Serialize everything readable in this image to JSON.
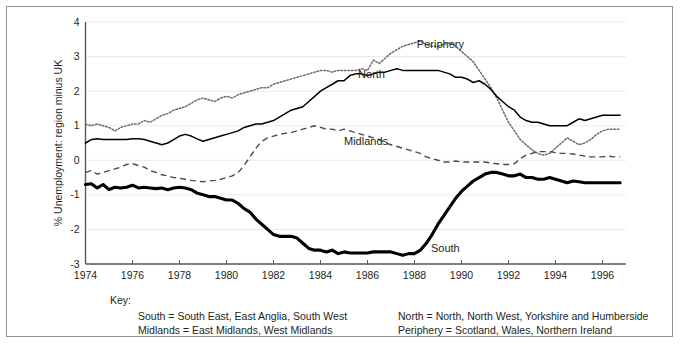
{
  "chart_data": {
    "type": "line",
    "title": "",
    "xlabel": "",
    "ylabel": "% Unemployment: region minus UK",
    "xlim": [
      1974,
      1997
    ],
    "ylim": [
      -3,
      4
    ],
    "xticks": [
      "1974",
      "1976",
      "1978",
      "1980",
      "1982",
      "1984",
      "1986",
      "1988",
      "1990",
      "1992",
      "1994",
      "1996"
    ],
    "yticks": [
      "4",
      "3",
      "2",
      "1",
      "0",
      "-1",
      "-2",
      "-3"
    ],
    "grid": true,
    "legend_position": "inline-labels",
    "x": [
      1974.0,
      1974.25,
      1974.5,
      1974.75,
      1975.0,
      1975.25,
      1975.5,
      1975.75,
      1976.0,
      1976.25,
      1976.5,
      1976.75,
      1977.0,
      1977.25,
      1977.5,
      1977.75,
      1978.0,
      1978.25,
      1978.5,
      1978.75,
      1979.0,
      1979.25,
      1979.5,
      1979.75,
      1980.0,
      1980.25,
      1980.5,
      1980.75,
      1981.0,
      1981.25,
      1981.5,
      1981.75,
      1982.0,
      1982.25,
      1982.5,
      1982.75,
      1983.0,
      1983.25,
      1983.5,
      1983.75,
      1984.0,
      1984.25,
      1984.5,
      1984.75,
      1985.0,
      1985.25,
      1985.5,
      1985.75,
      1986.0,
      1986.25,
      1986.5,
      1986.75,
      1987.0,
      1987.25,
      1987.5,
      1987.75,
      1988.0,
      1988.25,
      1988.5,
      1988.75,
      1989.0,
      1989.25,
      1989.5,
      1989.75,
      1990.0,
      1990.25,
      1990.5,
      1990.75,
      1991.0,
      1991.25,
      1991.5,
      1991.75,
      1992.0,
      1992.25,
      1992.5,
      1992.75,
      1993.0,
      1993.25,
      1993.5,
      1993.75,
      1994.0,
      1994.25,
      1994.5,
      1994.75,
      1995.0,
      1995.25,
      1995.5,
      1995.75,
      1996.0,
      1996.25,
      1996.5,
      1996.75
    ],
    "series": [
      {
        "name": "Periphery",
        "style": "dotted",
        "label_x": 1988.1,
        "label_y": 3.35,
        "values": [
          1.05,
          1.0,
          1.05,
          1.0,
          0.95,
          0.85,
          0.95,
          1.0,
          1.05,
          1.05,
          1.15,
          1.1,
          1.2,
          1.3,
          1.35,
          1.45,
          1.5,
          1.55,
          1.65,
          1.75,
          1.8,
          1.75,
          1.7,
          1.8,
          1.85,
          1.8,
          1.9,
          1.95,
          2.0,
          2.05,
          2.1,
          2.1,
          2.2,
          2.25,
          2.3,
          2.35,
          2.4,
          2.45,
          2.5,
          2.55,
          2.6,
          2.6,
          2.55,
          2.6,
          2.6,
          2.6,
          2.6,
          2.65,
          2.6,
          2.9,
          2.8,
          2.95,
          3.1,
          3.2,
          3.3,
          3.35,
          3.4,
          3.45,
          3.35,
          3.3,
          3.3,
          3.35,
          3.4,
          3.3,
          3.15,
          3.0,
          2.85,
          2.6,
          2.35,
          2.1,
          1.8,
          1.45,
          1.1,
          0.85,
          0.6,
          0.45,
          0.3,
          0.2,
          0.15,
          0.2,
          0.35,
          0.5,
          0.65,
          0.55,
          0.45,
          0.5,
          0.6,
          0.75,
          0.85,
          0.9,
          0.9,
          0.9
        ]
      },
      {
        "name": "North",
        "style": "solid-thin",
        "label_x": 1985.6,
        "label_y": 2.5,
        "values": [
          0.5,
          0.6,
          0.62,
          0.6,
          0.6,
          0.6,
          0.6,
          0.6,
          0.62,
          0.62,
          0.6,
          0.55,
          0.5,
          0.45,
          0.5,
          0.6,
          0.7,
          0.75,
          0.7,
          0.62,
          0.55,
          0.6,
          0.65,
          0.7,
          0.75,
          0.8,
          0.85,
          0.95,
          1.0,
          1.05,
          1.05,
          1.1,
          1.15,
          1.25,
          1.35,
          1.45,
          1.5,
          1.55,
          1.7,
          1.85,
          2.0,
          2.1,
          2.2,
          2.3,
          2.3,
          2.45,
          2.5,
          2.5,
          2.45,
          2.5,
          2.55,
          2.55,
          2.6,
          2.65,
          2.6,
          2.6,
          2.6,
          2.6,
          2.6,
          2.6,
          2.6,
          2.55,
          2.5,
          2.4,
          2.4,
          2.35,
          2.25,
          2.3,
          2.2,
          2.05,
          1.85,
          1.7,
          1.55,
          1.45,
          1.25,
          1.15,
          1.1,
          1.1,
          1.05,
          1.0,
          1.0,
          1.0,
          1.0,
          1.1,
          1.2,
          1.15,
          1.2,
          1.25,
          1.3,
          1.3,
          1.3,
          1.3
        ]
      },
      {
        "name": "Midlands",
        "style": "dashed",
        "label_x": 1985.0,
        "label_y": 0.55,
        "values": [
          -0.35,
          -0.3,
          -0.4,
          -0.35,
          -0.3,
          -0.25,
          -0.2,
          -0.12,
          -0.1,
          -0.15,
          -0.2,
          -0.3,
          -0.35,
          -0.42,
          -0.45,
          -0.5,
          -0.52,
          -0.55,
          -0.58,
          -0.6,
          -0.62,
          -0.6,
          -0.58,
          -0.55,
          -0.5,
          -0.45,
          -0.35,
          -0.15,
          0.1,
          0.35,
          0.55,
          0.65,
          0.7,
          0.75,
          0.78,
          0.8,
          0.85,
          0.9,
          0.95,
          1.0,
          0.95,
          0.9,
          0.9,
          0.85,
          0.9,
          0.85,
          0.8,
          0.75,
          0.7,
          0.65,
          0.6,
          0.5,
          0.45,
          0.4,
          0.35,
          0.3,
          0.25,
          0.2,
          0.1,
          0.05,
          0.0,
          -0.05,
          -0.05,
          -0.02,
          -0.05,
          -0.05,
          -0.05,
          -0.05,
          -0.05,
          -0.08,
          -0.1,
          -0.12,
          -0.12,
          -0.1,
          0.05,
          0.15,
          0.2,
          0.25,
          0.25,
          0.25,
          0.22,
          0.2,
          0.2,
          0.18,
          0.15,
          0.12,
          0.1,
          0.1,
          0.1,
          0.12,
          0.1,
          0.1
        ]
      },
      {
        "name": "South",
        "style": "solid-thick",
        "label_x": 1988.7,
        "label_y": -2.55,
        "values": [
          -0.7,
          -0.68,
          -0.8,
          -0.7,
          -0.85,
          -0.78,
          -0.8,
          -0.78,
          -0.72,
          -0.8,
          -0.78,
          -0.8,
          -0.82,
          -0.8,
          -0.85,
          -0.8,
          -0.78,
          -0.8,
          -0.85,
          -0.95,
          -1.0,
          -1.05,
          -1.05,
          -1.1,
          -1.15,
          -1.15,
          -1.25,
          -1.4,
          -1.5,
          -1.7,
          -1.85,
          -2.0,
          -2.15,
          -2.2,
          -2.2,
          -2.2,
          -2.25,
          -2.4,
          -2.55,
          -2.6,
          -2.6,
          -2.65,
          -2.6,
          -2.7,
          -2.65,
          -2.68,
          -2.68,
          -2.68,
          -2.68,
          -2.65,
          -2.65,
          -2.65,
          -2.65,
          -2.7,
          -2.75,
          -2.7,
          -2.7,
          -2.6,
          -2.4,
          -2.15,
          -1.85,
          -1.6,
          -1.35,
          -1.1,
          -0.9,
          -0.75,
          -0.6,
          -0.5,
          -0.4,
          -0.35,
          -0.35,
          -0.4,
          -0.45,
          -0.45,
          -0.4,
          -0.5,
          -0.5,
          -0.55,
          -0.55,
          -0.5,
          -0.55,
          -0.6,
          -0.65,
          -0.6,
          -0.62,
          -0.65,
          -0.65,
          -0.65,
          -0.65,
          -0.65,
          -0.65,
          -0.65
        ]
      }
    ]
  },
  "key": {
    "title": "Key:",
    "col1": [
      "South = South East, East Anglia, South West",
      "Midlands = East Midlands, West Midlands"
    ],
    "col2": [
      "North = North, North West, Yorkshire and Humberside",
      "Periphery = Scotland, Wales, Northern Ireland"
    ]
  }
}
